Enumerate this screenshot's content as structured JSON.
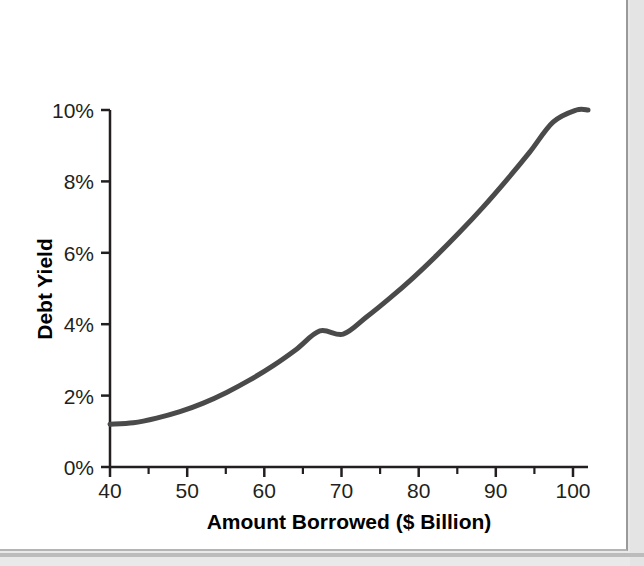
{
  "figure": {
    "background_color": "#ffffff",
    "page_background_color": "#e9e9e9",
    "frame_border_color": "#9a9a9a"
  },
  "chart_data": {
    "type": "line",
    "title": "",
    "subtitle": "",
    "xlabel": "Amount Borrowed ($ Billion)",
    "ylabel": "Debt Yield",
    "xlim": [
      40,
      101.5
    ],
    "ylim": [
      0,
      10
    ],
    "xticks": [
      40,
      50,
      60,
      70,
      80,
      90,
      100
    ],
    "xticklabels": [
      "40",
      "50",
      "60",
      "70",
      "80",
      "90",
      "100"
    ],
    "xminorticks": [
      45,
      55,
      65,
      75,
      85,
      95
    ],
    "yticks": [
      0,
      2,
      4,
      6,
      8,
      10
    ],
    "yticklabels": [
      "0%",
      "2%",
      "4%",
      "6%",
      "8%",
      "10%"
    ],
    "grid": false,
    "legend": null,
    "annotations": [],
    "line_color": "#4a4a4a",
    "line_width": 5,
    "series": [
      {
        "name": "Debt Yield",
        "x": [
          40,
          42,
          44,
          46,
          48,
          50,
          52,
          54,
          56,
          58,
          60,
          62,
          64,
          66,
          68,
          70,
          72,
          74,
          76,
          78,
          80,
          82,
          84,
          86,
          88,
          90,
          92,
          94,
          96,
          98,
          100,
          101.5
        ],
        "values": [
          1.2,
          1.22,
          1.28,
          1.37,
          1.48,
          1.62,
          1.79,
          1.98,
          2.2,
          2.44,
          2.7,
          2.99,
          3.3,
          3.64,
          4.0,
          3.95,
          4.38,
          4.82,
          5.28,
          5.76,
          6.26,
          6.78,
          7.31,
          7.86,
          8.43,
          9.02,
          9.62,
          10.0,
          10.0,
          10.0,
          10.0,
          10.0
        ]
      }
    ],
    "curve_points": [
      [
        40,
        1.2
      ],
      [
        43,
        1.24
      ],
      [
        46,
        1.37
      ],
      [
        49,
        1.55
      ],
      [
        52,
        1.79
      ],
      [
        55,
        2.09
      ],
      [
        58,
        2.44
      ],
      [
        61,
        2.84
      ],
      [
        64,
        3.3
      ],
      [
        67,
        3.81
      ],
      [
        70,
        3.72
      ],
      [
        73,
        4.2
      ],
      [
        76,
        4.73
      ],
      [
        79,
        5.3
      ],
      [
        82,
        5.92
      ],
      [
        85,
        6.58
      ],
      [
        88,
        7.28
      ],
      [
        91,
        8.03
      ],
      [
        94,
        8.82
      ],
      [
        97,
        9.66
      ],
      [
        100,
        10.0
      ],
      [
        101.5,
        10.0
      ]
    ]
  },
  "axis_labels": {
    "x_title": "Amount Borrowed ($ Billion)",
    "y_title": "Debt Yield"
  },
  "y_tick_labels": [
    "10%",
    "8%",
    "6%",
    "4%",
    "2%",
    "0%"
  ],
  "x_tick_labels": [
    "40",
    "50",
    "60",
    "70",
    "80",
    "90",
    "100"
  ]
}
